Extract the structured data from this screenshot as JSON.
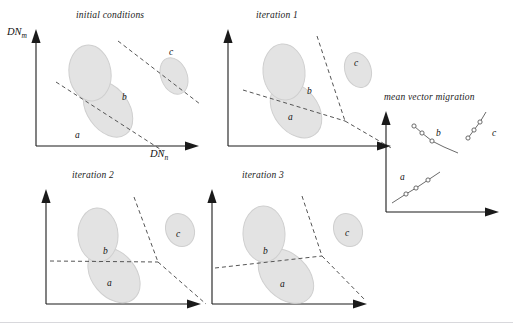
{
  "figure": {
    "axis_labels": {
      "y": "DN",
      "y_sub": "m",
      "x": "DN",
      "x_sub": "n"
    },
    "cluster_labels": {
      "a": "a",
      "b": "b",
      "c": "c"
    },
    "colors": {
      "cluster_fill": "#e3e3e3",
      "cluster_stroke": "#c9c9c9",
      "axis": "#1a1a1a",
      "boundary_dash": "#555555",
      "background": "#ffffff",
      "rule": "#d8d8dc"
    }
  },
  "panels": [
    {
      "id": "initial-conditions",
      "title": "initial conditions",
      "has_axis_labels": true,
      "clusters": [
        {
          "name": "a",
          "label": "a",
          "cx": 90,
          "cy": 103,
          "rx": 21,
          "ry": 31,
          "rot": -35,
          "label_x": 57,
          "label_y": 130
        },
        {
          "name": "b",
          "label": "b",
          "cx": 72,
          "cy": 67,
          "rx": 21,
          "ry": 28,
          "rot": -8,
          "label_x": 104,
          "label_y": 93
        },
        {
          "name": "c",
          "label": "c",
          "cx": 156,
          "cy": 70,
          "rx": 13,
          "ry": 19,
          "rot": -22,
          "label_x": 151,
          "label_y": 48
        }
      ],
      "boundaries": [
        {
          "name": "ab-boundary",
          "x1": 38,
          "y1": 76,
          "x2": 145,
          "y2": 145
        },
        {
          "name": "bc-boundary",
          "x1": 100,
          "y1": 35,
          "x2": 182,
          "y2": 98
        }
      ]
    },
    {
      "id": "iteration-1",
      "title": "iteration 1",
      "has_axis_labels": false,
      "clusters": [
        {
          "name": "a",
          "label": "a",
          "cx": 86,
          "cy": 104,
          "rx": 22,
          "ry": 31,
          "rot": -38,
          "label_x": 78,
          "label_y": 112
        },
        {
          "name": "b",
          "label": "b",
          "cx": 74,
          "cy": 66,
          "rx": 21,
          "ry": 28,
          "rot": -5,
          "label_x": 97,
          "label_y": 87
        },
        {
          "name": "c",
          "label": "c",
          "cx": 148,
          "cy": 64,
          "rx": 13,
          "ry": 18,
          "rot": -18,
          "label_x": 144,
          "label_y": 58
        }
      ],
      "boundaries": [
        {
          "name": "ab-boundary",
          "x1": 33,
          "y1": 84,
          "x2": 135,
          "y2": 115
        },
        {
          "name": "bc-boundary",
          "x1": 107,
          "y1": 30,
          "x2": 135,
          "y2": 115
        },
        {
          "name": "ac-boundary",
          "x1": 135,
          "y1": 115,
          "x2": 183,
          "y2": 143
        }
      ]
    },
    {
      "id": "iteration-2",
      "title": "iteration 2",
      "has_axis_labels": false,
      "clusters": [
        {
          "name": "a",
          "label": "a",
          "cx": 84,
          "cy": 107,
          "rx": 22,
          "ry": 31,
          "rot": -40,
          "label_x": 77,
          "label_y": 116
        },
        {
          "name": "b",
          "label": "b",
          "cx": 68,
          "cy": 67,
          "rx": 20,
          "ry": 27,
          "rot": -3,
          "label_x": 73,
          "label_y": 85
        },
        {
          "name": "c",
          "label": "c",
          "cx": 150,
          "cy": 62,
          "rx": 14,
          "ry": 17,
          "rot": -24,
          "label_x": 146,
          "label_y": 68
        }
      ],
      "boundaries": [
        {
          "name": "ab-boundary",
          "x1": 28,
          "y1": 93,
          "x2": 128,
          "y2": 94
        },
        {
          "name": "bc-boundary",
          "x1": 104,
          "y1": 29,
          "x2": 128,
          "y2": 94
        },
        {
          "name": "ac-boundary",
          "x1": 128,
          "y1": 94,
          "x2": 180,
          "y2": 140
        }
      ]
    },
    {
      "id": "iteration-3",
      "title": "iteration 3",
      "has_axis_labels": false,
      "clusters": [
        {
          "name": "a",
          "label": "a",
          "cx": 90,
          "cy": 108,
          "rx": 22,
          "ry": 32,
          "rot": -46,
          "label_x": 84,
          "label_y": 117
        },
        {
          "name": "b",
          "label": "b",
          "cx": 68,
          "cy": 66,
          "rx": 21,
          "ry": 28,
          "rot": -2,
          "label_x": 67,
          "label_y": 84
        },
        {
          "name": "c",
          "label": "c",
          "cx": 152,
          "cy": 62,
          "rx": 14,
          "ry": 17,
          "rot": -24,
          "label_x": 149,
          "label_y": 67
        }
      ],
      "boundaries": [
        {
          "name": "ab-boundary",
          "x1": 27,
          "y1": 100,
          "x2": 126,
          "y2": 88
        },
        {
          "name": "bc-boundary",
          "x1": 106,
          "y1": 28,
          "x2": 126,
          "y2": 88
        },
        {
          "name": "ac-boundary",
          "x1": 126,
          "y1": 88,
          "x2": 170,
          "y2": 135
        }
      ]
    }
  ],
  "migration_panel": {
    "id": "mean-vector-migration",
    "title": "mean vector migration",
    "tracks": [
      {
        "name": "a",
        "label": "a",
        "label_x": 18,
        "label_y": 78,
        "path": [
          [
            10,
            103
          ],
          [
            24,
            94
          ],
          [
            34,
            88
          ],
          [
            46,
            80
          ],
          [
            58,
            72
          ]
        ],
        "markers": [
          [
            24,
            94
          ],
          [
            34,
            88
          ],
          [
            46,
            80
          ]
        ]
      },
      {
        "name": "b",
        "label": "b",
        "label_x": 52,
        "label_y": 40,
        "path": [
          [
            32,
            26
          ],
          [
            40,
            33
          ],
          [
            50,
            41
          ],
          [
            62,
            47
          ],
          [
            76,
            53
          ]
        ],
        "markers": [
          [
            32,
            26
          ],
          [
            40,
            33
          ],
          [
            50,
            41
          ]
        ]
      },
      {
        "name": "c",
        "label": "c",
        "label_x": 112,
        "label_y": 30,
        "path": [
          [
            88,
            38
          ],
          [
            94,
            30
          ],
          [
            100,
            22
          ],
          [
            106,
            12
          ]
        ],
        "markers": [
          [
            88,
            38
          ],
          [
            94,
            30
          ],
          [
            100,
            22
          ]
        ]
      }
    ]
  }
}
